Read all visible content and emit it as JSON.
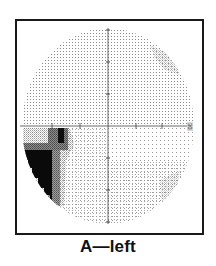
{
  "figure": {
    "caption": "A—left",
    "eye": "left",
    "panel_label": "A",
    "axis_end_label": "30"
  },
  "field": {
    "center": {
      "x": 108,
      "y": 126
    },
    "radius_x": 86,
    "radius_y": 98,
    "axis_color": "#444444",
    "dot_color": "#8a8a8a",
    "horizontal_ticks_x": [
      52,
      80,
      136,
      162
    ],
    "vertical_ticks_y": [
      30,
      62,
      94,
      158,
      190,
      222
    ]
  },
  "defect": {
    "location": "inferior nasal (lower-left)",
    "colors": {
      "black": "#0a0a0a",
      "dark_grey": "#5a5a5a",
      "mid_grey": "#8c8c8c",
      "light_stipple": "#bdbdbd"
    }
  }
}
